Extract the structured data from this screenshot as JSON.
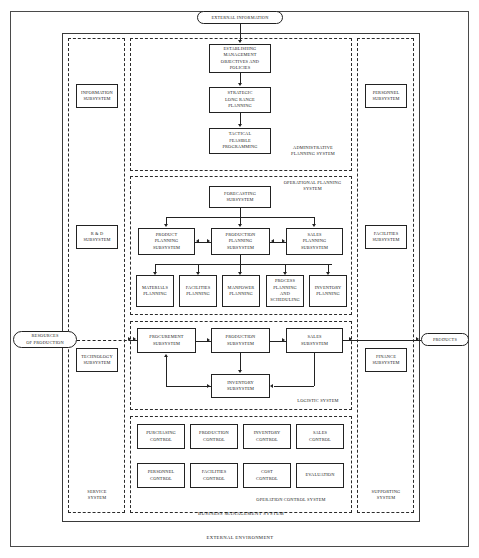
{
  "diagram": {
    "external_environment_label": "EXTERNAL ENVIRONMENT",
    "terminators": {
      "external_information": "EXTERNAL INFORMATION",
      "resources_of_production": "RESOURCES\nOF PRODUCTION",
      "products": "PRODUCTS"
    },
    "system_labels": {
      "administrative_planning": "ADMINISTRATIVE\nPLANNING SYSTEM",
      "operational_planning": "OPERATIONAL PLANNING\nSYSTEM",
      "logistic": "LOGISTIC SYSTEM",
      "operation_control": "OPERATION CONTROL SYSTEM",
      "service": "SERVICE\nSYSTEM",
      "supporting": "SUPPORTING\nSYSTEM",
      "business_management": "BUSINESS MANAGEMENT SYSTEM"
    },
    "service_system": {
      "boxes": [
        {
          "id": "information-subsystem",
          "label": "INFORMATION\nSUBSYSTEM"
        },
        {
          "id": "rd-subsystem",
          "label": "R & D\nSUBSYSTEM"
        },
        {
          "id": "technology-subsystem",
          "label": "TECHNOLOGY\nSUBSYSTEM"
        }
      ]
    },
    "supporting_system": {
      "boxes": [
        {
          "id": "personnel-subsystem",
          "label": "PERSONNEL\nSUBSYSTEM"
        },
        {
          "id": "facilities-subsystem",
          "label": "FACILITIES\nSUBSYSTEM"
        },
        {
          "id": "finance-subsystem",
          "label": "FINANCE\nSUBSYSTEM"
        }
      ]
    },
    "administrative_planning_system": {
      "boxes": [
        {
          "id": "establishing-management-objectives",
          "label": "ESTABLISHING\nMANAGEMENT\nOBJECTIVES AND\nPOLICIES"
        },
        {
          "id": "strategic-long-range-planning",
          "label": "STRATEGIC\nLONG RANGE\nPLANNING"
        },
        {
          "id": "tactical-feasible-programming",
          "label": "TACTICAL\nFEASIBLE\nPROGRAMMING"
        }
      ]
    },
    "operational_planning_system": {
      "forecasting": {
        "id": "forecasting-subsystem",
        "label": "FORECASTING\nSUBSYSTEM"
      },
      "planning_row": [
        {
          "id": "product-planning-subsystem",
          "label": "PRODUCT\nPLANNING\nSUBSYSTEM"
        },
        {
          "id": "production-planning-subsystem",
          "label": "PRODUCTION\nPLANNING\nSUBSYSTEM"
        },
        {
          "id": "sales-planning-subsystem",
          "label": "SALES\nPLANNING\nSUBSYSTEM"
        }
      ],
      "detail_row": [
        {
          "id": "materials-planning",
          "label": "MATERIALS\nPLANNING"
        },
        {
          "id": "facilities-planning",
          "label": "FACILITIES\nPLANNING"
        },
        {
          "id": "manpower-planning",
          "label": "MANPOWER\nPLANNING"
        },
        {
          "id": "process-planning-and-scheduling",
          "label": "PROCESS\nPLANNING\nAND\nSCHEDULING"
        },
        {
          "id": "inventory-planning",
          "label": "INVENTORY\nPLANNING"
        }
      ]
    },
    "logistic_system": {
      "top_row": [
        {
          "id": "procurement-subsystem",
          "label": "PROCUREMENT\nSUBSYSTEM"
        },
        {
          "id": "production-subsystem",
          "label": "PRODUCTION\nSUBSYSTEM"
        },
        {
          "id": "sales-subsystem",
          "label": "SALES\nSUBSYSTEM"
        }
      ],
      "inventory": {
        "id": "inventory-subsystem",
        "label": "INVENTORY\nSUBSYSTEM"
      }
    },
    "operation_control_system": {
      "row1": [
        {
          "id": "purchasing-control",
          "label": "PURCHASING\nCONTROL"
        },
        {
          "id": "production-control",
          "label": "PRODUCTION\nCONTROL"
        },
        {
          "id": "inventory-control",
          "label": "INVENTORY\nCONTROL"
        },
        {
          "id": "sales-control",
          "label": "SALES\nCONTROL"
        }
      ],
      "row2": [
        {
          "id": "personnel-control",
          "label": "PERSONNEL\nCONTROL"
        },
        {
          "id": "facilities-control",
          "label": "FACILITIES\nCONTROL"
        },
        {
          "id": "cost-control",
          "label": "COST\nCONTROL"
        },
        {
          "id": "evaluation",
          "label": "EVALUATION"
        }
      ]
    },
    "colors": {
      "stroke": "#222222",
      "frame": "#3a3a3a",
      "background": "#ffffff"
    }
  }
}
